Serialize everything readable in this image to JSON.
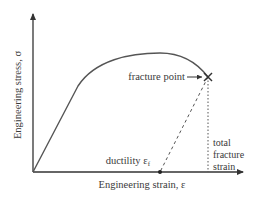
{
  "diagram": {
    "axes": {
      "x_label": "Engineering strain, ε",
      "y_label": "Engineering stress, σ"
    },
    "annotations": {
      "fracture_point": "fracture point",
      "ductility": "ductility ε",
      "ductility_subscript": "f",
      "total_fracture_strain_line1": "total",
      "total_fracture_strain_line2": "fracture",
      "total_fracture_strain_line3": "strain"
    },
    "markers": {
      "fracture_marker": "×"
    },
    "colors": {
      "curve": "#555555",
      "axes": "#333333",
      "text": "#3a3a3a",
      "dashed": "#555555"
    }
  }
}
